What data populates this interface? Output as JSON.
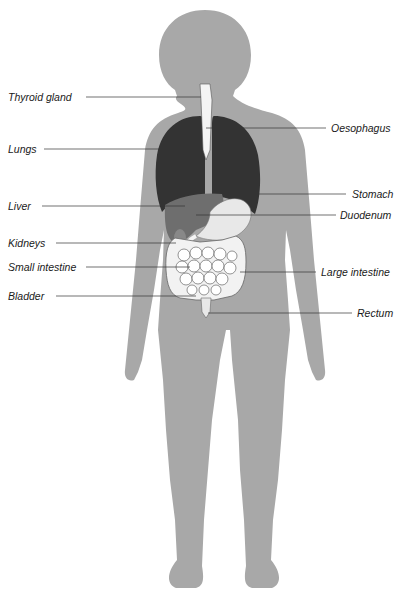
{
  "diagram": {
    "colors": {
      "body": "#a8a8a8",
      "lungs": "#333333",
      "liver": "#6e6e6e",
      "trachea": "#f4f4f4",
      "stomach": "#e8e8e8",
      "intestine": "#f2f2f2",
      "kidney": "#888888",
      "lines": "#333333",
      "background": "#ffffff"
    },
    "labels_left": [
      {
        "id": "thyroid",
        "text": "Thyroid gland",
        "x": 8,
        "y": 92
      },
      {
        "id": "lungs",
        "text": "Lungs",
        "x": 8,
        "y": 144
      },
      {
        "id": "liver",
        "text": "Liver",
        "x": 8,
        "y": 201
      },
      {
        "id": "kidneys",
        "text": "Kidneys",
        "x": 8,
        "y": 238
      },
      {
        "id": "small-intestine",
        "text": "Small intestine",
        "x": 8,
        "y": 262
      },
      {
        "id": "bladder",
        "text": "Bladder",
        "x": 8,
        "y": 291
      }
    ],
    "labels_right": [
      {
        "id": "oesophagus",
        "text": "Oesophagus",
        "x": 332,
        "y": 123
      },
      {
        "id": "stomach",
        "text": "Stomach",
        "x": 352,
        "y": 189
      },
      {
        "id": "duodenum",
        "text": "Duodenum",
        "x": 341,
        "y": 210
      },
      {
        "id": "large-intestine",
        "text": "Large intestine",
        "x": 322,
        "y": 267
      },
      {
        "id": "rectum",
        "text": "Rectum",
        "x": 357,
        "y": 308
      }
    ]
  }
}
